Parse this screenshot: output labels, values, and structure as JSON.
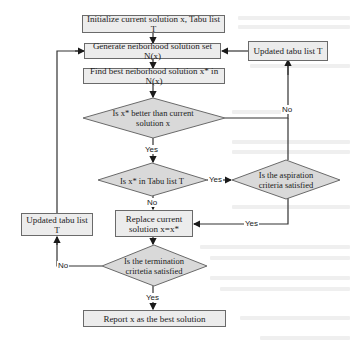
{
  "diagram": {
    "type": "flowchart",
    "colors": {
      "box_fill": "#ececec",
      "box_border": "#6a6a6a",
      "diamond_fill": "#d9d9d9",
      "line": "#333333",
      "background": "#ffffff"
    },
    "nodes": {
      "init": "Initialize current solution x, Tabu list T",
      "generate": "Generate neiborhood solution set N(x)",
      "find_best": "Find best neiborhood solution x* in N(x)",
      "better_line1": "Is x* better than current",
      "better_line2": "solution x",
      "in_tabu": "Is x* in Tabu list T",
      "aspiration_line1": "Is the aspiration",
      "aspiration_line2": "criteria satisfied",
      "replace_line1": "Replace current",
      "replace_line2": "solution x=x*",
      "updated_tabu_top": "Updated tabu list T",
      "updated_tabu_left": "Updated tabu list T",
      "termination_line1": "Is the termination",
      "termination_line2": "crirtetia satisfied",
      "report": "Report x as the best solution"
    },
    "edge_labels": {
      "better_no": "No",
      "better_yes": "Yes",
      "tabu_yes": "Yes",
      "tabu_no": "No",
      "aspiration_yes": "Yes",
      "termination_no": "No",
      "termination_yes": "Yes"
    }
  }
}
